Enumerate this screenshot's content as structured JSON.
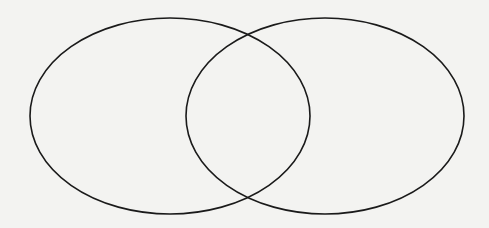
{
  "diagram": {
    "type": "venn",
    "background": "#f3f3f1",
    "stroke_color": "#1a1a1a",
    "stroke_width": 1.6,
    "sets": [
      {
        "id": "left",
        "label": "",
        "cx": 170,
        "cy": 116,
        "rx": 140,
        "ry": 98
      },
      {
        "id": "right",
        "label": "",
        "cx": 325,
        "cy": 116,
        "rx": 139,
        "ry": 98
      }
    ],
    "labels": []
  }
}
